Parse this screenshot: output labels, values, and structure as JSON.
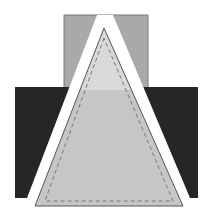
{
  "diagram": {
    "width": 210,
    "height": 216,
    "colors": {
      "background": "#ffffff",
      "back_panel": "#a9a9a9",
      "back_panel_stroke": "#7a7a7a",
      "base_panel": "#262626",
      "gap": "#ffffff",
      "triangle_upper": "#d9d9d9",
      "triangle_lower": "#c6c6c6",
      "triangle_stroke": "#555555",
      "stitch": "#777777"
    },
    "shapes": {
      "back_panel": {
        "points": "64,15 148,15 148,88 64,88"
      },
      "base_panel": {
        "points": "15,87 198,87 198,198 15,198"
      },
      "gap_wedge": {
        "points": "97,15 113,15 190,198 27,198"
      },
      "triangle": {
        "points": "104,28 35,206 183,206"
      },
      "triangle_upper_clip_y": 90,
      "stitch_line": {
        "points": "104,38 45,201 173,201"
      }
    }
  }
}
